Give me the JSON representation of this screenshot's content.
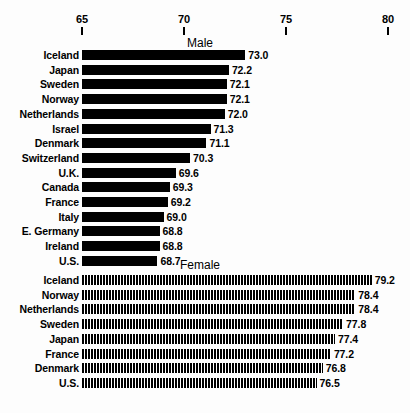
{
  "chart_data": {
    "type": "bar",
    "title": "",
    "xlabel": "",
    "ylabel": "",
    "orientation": "horizontal",
    "xlim": [
      65,
      80
    ],
    "grid": false,
    "legend": "none",
    "axis": {
      "ticks": [
        65,
        70,
        75,
        80
      ],
      "tick_labels": [
        "65",
        "70",
        "75",
        "80"
      ],
      "position": "top"
    },
    "panels": [
      {
        "name": "male",
        "title": "Male",
        "fill": "solid-black",
        "categories": [
          "Iceland",
          "Japan",
          "Sweden",
          "Norway",
          "Netherlands",
          "Israel",
          "Denmark",
          "Switzerland",
          "U.K.",
          "Canada",
          "France",
          "Italy",
          "E. Germany",
          "Ireland",
          "U.S."
        ],
        "values": [
          73.0,
          72.2,
          72.1,
          72.1,
          72.0,
          71.3,
          71.1,
          70.3,
          69.6,
          69.3,
          69.2,
          69.0,
          68.8,
          68.8,
          68.7
        ],
        "value_labels": [
          "73.0",
          "72.2",
          "72.1",
          "72.1",
          "72.0",
          "71.3",
          "71.1",
          "70.3",
          "69.6",
          "69.3",
          "69.2",
          "69.0",
          "68.8",
          "68.8",
          "68.7"
        ]
      },
      {
        "name": "female",
        "title": "Female",
        "fill": "vertical-hatch",
        "categories": [
          "Iceland",
          "Norway",
          "Netherlands",
          "Sweden",
          "Japan",
          "France",
          "Denmark",
          "U.S."
        ],
        "values": [
          79.2,
          78.4,
          78.4,
          77.8,
          77.4,
          77.2,
          76.8,
          76.5
        ],
        "value_labels": [
          "79.2",
          "78.4",
          "78.4",
          "77.8",
          "77.4",
          "77.2",
          "76.8",
          "76.5"
        ]
      }
    ]
  }
}
